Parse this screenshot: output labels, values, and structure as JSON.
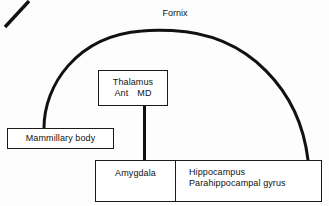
{
  "diagram": {
    "title_caption": "Fornix",
    "background_color": "#fdfdfd",
    "stroke_color": "#111111",
    "boxes": {
      "thalamus": {
        "label": "Thalamus",
        "nucleus_ant": "Ant",
        "nucleus_md": "MD"
      },
      "mammillary": {
        "label": "Mammillary body"
      },
      "amygdala": {
        "label": "Amygdala"
      },
      "hippocampal": {
        "line1": "Hippocampus",
        "line2": "Parahippocampal gyrus"
      }
    },
    "connectors": {
      "fornix_arc": "fornix-arc",
      "thalamus_to_mammillary": "mammillothalamic-tract",
      "thalamus_to_amygdala": "amygdalofugal-pathway"
    }
  }
}
